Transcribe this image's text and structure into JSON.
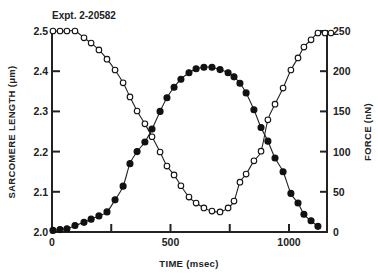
{
  "chart_data": {
    "type": "scatter",
    "title": "Expt. 2-20582",
    "xlabel": "TIME (msec)",
    "ylabel_left": "SARCOMERE LENGTH (μm)",
    "ylabel_right": "FORCE (nN)",
    "xlim": [
      0,
      1160
    ],
    "ylim_left": [
      2.0,
      2.5
    ],
    "ylim_right": [
      0,
      250
    ],
    "x_ticks": [
      0,
      250,
      500,
      750,
      1000
    ],
    "x_tick_labels": [
      "0",
      "",
      "500",
      "",
      "1000"
    ],
    "y_left_ticks": [
      2.0,
      2.1,
      2.2,
      2.3,
      2.4,
      2.5
    ],
    "y_left_tick_labels": [
      "2.0",
      "2.1",
      "2.2",
      "2.3",
      "2.4",
      "2.5"
    ],
    "y_right_ticks": [
      0,
      50,
      100,
      150,
      200,
      250
    ],
    "y_right_tick_labels": [
      "0",
      "50",
      "100",
      "150",
      "200",
      "250"
    ],
    "grid": false,
    "legend": null,
    "series": [
      {
        "name": "Sarcomere length",
        "axis": "left",
        "marker": "open-circle",
        "x": [
          4,
          34,
          63,
          97,
          135,
          165,
          198,
          232,
          266,
          300,
          329,
          359,
          392,
          422,
          456,
          485,
          515,
          544,
          578,
          608,
          641,
          675,
          709,
          743,
          768,
          793,
          819,
          852,
          882,
          911,
          941,
          975,
          1008,
          1038,
          1063,
          1093,
          1122,
          1152,
          1177
        ],
        "values": [
          2.5,
          2.5,
          2.5,
          2.5,
          2.483,
          2.47,
          2.453,
          2.43,
          2.403,
          2.371,
          2.336,
          2.301,
          2.269,
          2.237,
          2.199,
          2.164,
          2.142,
          2.115,
          2.087,
          2.072,
          2.06,
          2.052,
          2.05,
          2.06,
          2.077,
          2.124,
          2.144,
          2.177,
          2.201,
          2.279,
          2.318,
          2.358,
          2.403,
          2.433,
          2.46,
          2.478,
          2.495,
          2.495,
          2.495
        ]
      },
      {
        "name": "Force",
        "axis": "right",
        "marker": "filled-circle",
        "x": [
          4,
          34,
          63,
          97,
          135,
          165,
          198,
          232,
          266,
          300,
          329,
          359,
          392,
          422,
          456,
          485,
          515,
          544,
          578,
          608,
          641,
          675,
          709,
          743,
          768,
          793,
          819,
          852,
          882,
          911,
          941,
          975,
          1008,
          1038,
          1063,
          1093,
          1122
        ],
        "values": [
          2,
          3,
          4,
          8,
          12,
          16,
          20,
          25,
          40,
          57,
          85,
          100,
          112,
          128,
          150,
          167,
          180,
          190,
          198,
          203,
          205,
          205,
          202,
          198,
          193,
          185,
          173,
          152,
          130,
          113,
          92,
          75,
          48,
          36,
          22,
          14,
          7
        ]
      }
    ],
    "fit_curves": [
      "smooth line through sarcomere length points",
      "smooth line through force points"
    ]
  }
}
